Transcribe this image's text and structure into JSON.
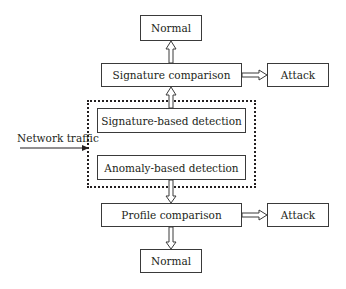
{
  "diagram": {
    "nodes": {
      "normal_top": "Normal",
      "signature_comparison": "Signature comparison",
      "attack_top": "Attack",
      "signature_detection": "Signature-based detection",
      "anomaly_detection": "Anomaly-based detection",
      "profile_comparison": "Profile comparison",
      "attack_bottom": "Attack",
      "normal_bottom": "Normal"
    },
    "input_label": "Network traffic",
    "group": "IDS detection module (dashed)",
    "edges": [
      {
        "from": "Network traffic",
        "to": "detection module"
      },
      {
        "from": "Signature-based detection",
        "to": "Signature comparison"
      },
      {
        "from": "Signature comparison",
        "to": "Normal (top)"
      },
      {
        "from": "Signature comparison",
        "to": "Attack (top)"
      },
      {
        "from": "Anomaly-based detection",
        "to": "Profile comparison"
      },
      {
        "from": "Profile comparison",
        "to": "Attack (bottom)"
      },
      {
        "from": "Profile comparison",
        "to": "Normal (bottom)"
      }
    ]
  }
}
